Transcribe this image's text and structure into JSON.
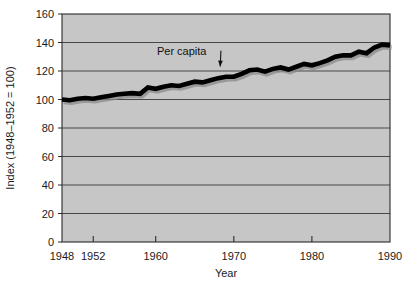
{
  "chart_data": {
    "type": "line",
    "title": "",
    "xlabel": "Year",
    "ylabel": "Index (1948–1952 = 100)",
    "xlim": [
      1948,
      1990
    ],
    "ylim": [
      0,
      160
    ],
    "grid": true,
    "grid_axis": "y",
    "legend_position": "inline-annotation",
    "plot_background": "#c6c6c6",
    "line_color": "#000000",
    "annotations": [
      {
        "text": "Per capita",
        "x": 1964,
        "y": 137,
        "arrow_to_x": 1968,
        "arrow_to_y": 121
      }
    ],
    "xticks": [
      1948,
      1952,
      1960,
      1970,
      1980,
      1990
    ],
    "xtick_labels": [
      "1948",
      "1952",
      "1960",
      "1970",
      "1980",
      "1990"
    ],
    "yticks": [
      0,
      20,
      40,
      60,
      80,
      100,
      120,
      140,
      160
    ],
    "ytick_labels": [
      "0",
      "20",
      "40",
      "60",
      "80",
      "100",
      "120",
      "140",
      "160"
    ],
    "series": [
      {
        "name": "Per capita",
        "x": [
          1948,
          1949,
          1950,
          1951,
          1952,
          1953,
          1954,
          1955,
          1956,
          1957,
          1958,
          1959,
          1960,
          1961,
          1962,
          1963,
          1964,
          1965,
          1966,
          1967,
          1968,
          1969,
          1970,
          1971,
          1972,
          1973,
          1974,
          1975,
          1976,
          1977,
          1978,
          1979,
          1980,
          1981,
          1982,
          1983,
          1984,
          1985,
          1986,
          1987,
          1988,
          1989,
          1990
        ],
        "values": [
          100.0,
          99.5,
          100.5,
          101.0,
          100.5,
          101.5,
          102.5,
          103.5,
          104.0,
          104.5,
          104.0,
          108.5,
          107.5,
          109.0,
          110.0,
          109.5,
          111.0,
          112.5,
          112.0,
          113.5,
          115.0,
          116.0,
          116.0,
          118.0,
          120.5,
          121.0,
          119.5,
          121.5,
          122.5,
          121.0,
          123.0,
          125.0,
          124.0,
          125.5,
          127.5,
          130.0,
          131.0,
          131.0,
          133.5,
          132.5,
          136.5,
          138.5,
          138.0
        ]
      }
    ]
  },
  "axis": {
    "ylabel_text": "Index (1948–1952 = 100)",
    "xlabel_text": "Year"
  }
}
